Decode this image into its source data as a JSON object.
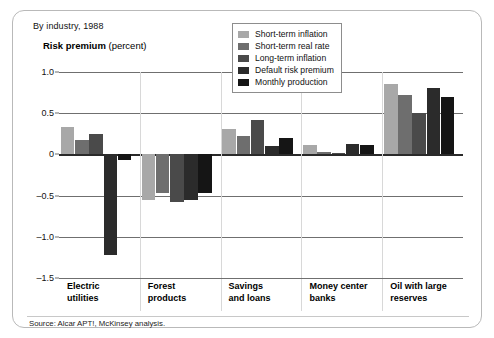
{
  "header": {
    "subhead": "By industry, 1988",
    "axis_title_strong": "Risk premium",
    "axis_title_light": "(percent)"
  },
  "footer": {
    "source": "Source: Alcar APT!, McKinsey analysis."
  },
  "legend": {
    "items": [
      {
        "label": "Short-term inflation",
        "color": "#a8a8a8"
      },
      {
        "label": "Short-term real rate",
        "color": "#6e6e6e"
      },
      {
        "label": "Long-term inflation",
        "color": "#4a4a4a"
      },
      {
        "label": "Default risk premium",
        "color": "#2b2b2b"
      },
      {
        "label": "Monthly production",
        "color": "#151515"
      }
    ]
  },
  "chart_data": {
    "type": "bar",
    "title": "Risk premium (percent)",
    "subtitle": "By industry, 1988",
    "xlabel": "",
    "ylabel": "Risk premium (percent)",
    "ylim": [
      -1.5,
      1.0
    ],
    "yticks": [
      1.0,
      0.5,
      0,
      -0.5,
      -1.0,
      -1.5
    ],
    "ytick_labels": [
      "1.0",
      "0.5",
      "0",
      "–0.5",
      "–1.0",
      "–1.5"
    ],
    "grid": true,
    "legend_position": "top-right",
    "categories": [
      "Electric utilities",
      "Forest products",
      "Savings and loans",
      "Money center banks",
      "Oil with large reserves"
    ],
    "category_lines": [
      [
        "Electric",
        "utilities"
      ],
      [
        "Forest",
        "products"
      ],
      [
        "Savings",
        "and loans"
      ],
      [
        "Money center",
        "banks"
      ],
      [
        "Oil with large",
        "reserves"
      ]
    ],
    "series": [
      {
        "name": "Short-term inflation",
        "color": "#a8a8a8",
        "values": [
          0.33,
          -0.55,
          0.31,
          0.11,
          0.85
        ]
      },
      {
        "name": "Short-term real rate",
        "color": "#6e6e6e",
        "values": [
          0.18,
          -0.47,
          0.22,
          0.03,
          0.72
        ]
      },
      {
        "name": "Long-term inflation",
        "color": "#4a4a4a",
        "values": [
          0.25,
          -0.58,
          0.42,
          0.02,
          0.5
        ]
      },
      {
        "name": "Default risk premium",
        "color": "#2b2b2b",
        "values": [
          -1.22,
          -0.55,
          0.1,
          0.13,
          0.8
        ]
      },
      {
        "name": "Monthly production",
        "color": "#151515",
        "values": [
          -0.07,
          -0.47,
          0.2,
          0.12,
          0.7
        ]
      }
    ]
  }
}
